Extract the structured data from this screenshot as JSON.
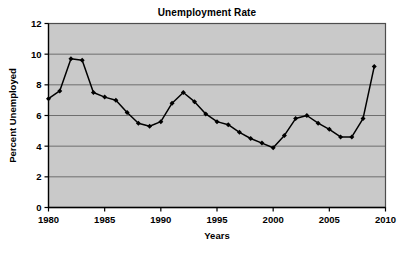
{
  "chart_data": {
    "type": "line",
    "title": "Unemployment Rate",
    "xlabel": "Years",
    "ylabel": "Percent Unemployed",
    "xlim": [
      1980,
      2010
    ],
    "ylim": [
      0,
      12
    ],
    "xticks": [
      1980,
      1985,
      1990,
      1995,
      2000,
      2005,
      2010
    ],
    "xtick_labels": [
      "1980",
      "1985",
      "1990",
      "1995",
      "2000",
      "2005",
      "2010"
    ],
    "yticks": [
      0,
      2,
      4,
      6,
      8,
      10,
      12
    ],
    "ytick_labels": [
      "0",
      "2",
      "4",
      "6",
      "8",
      "10",
      "12"
    ],
    "grid": "horizontal",
    "legend": "none",
    "x": [
      1980,
      1981,
      1982,
      1983,
      1984,
      1985,
      1986,
      1987,
      1988,
      1989,
      1990,
      1991,
      1992,
      1993,
      1994,
      1995,
      1996,
      1997,
      1998,
      1999,
      2000,
      2001,
      2002,
      2003,
      2004,
      2005,
      2006,
      2007,
      2008,
      2009
    ],
    "values": [
      7.1,
      7.6,
      9.7,
      9.6,
      7.5,
      7.2,
      7.0,
      6.2,
      5.5,
      5.3,
      5.6,
      6.8,
      7.5,
      6.9,
      6.1,
      5.6,
      5.4,
      4.9,
      4.5,
      4.2,
      3.9,
      4.7,
      5.8,
      6.0,
      5.5,
      5.1,
      4.6,
      4.6,
      5.8,
      9.2
    ],
    "series_name": "Unemployment Rate",
    "line_color": "#000000",
    "marker": "diamond",
    "marker_color": "#000000",
    "plot_background": "#c9c9c9",
    "grid_color": "#6e6e6e",
    "frame_color": "#4d4d4d"
  }
}
